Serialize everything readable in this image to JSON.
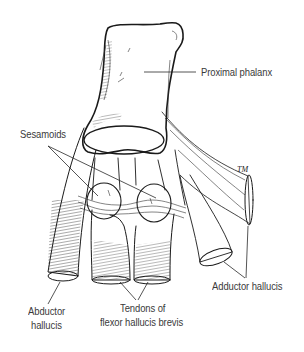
{
  "figure": {
    "signature": "TM",
    "colors": {
      "ink": "#1a1a1a",
      "label_text": "#3a3a3a",
      "background": "#ffffff"
    }
  },
  "labels": {
    "proximal_phalanx": "Proximal phalanx",
    "sesamoids": "Sesamoids",
    "adductor_hallucis": "Adductor hallucis",
    "abductor_hallucis_line1": "Abductor",
    "abductor_hallucis_line2": "hallucis",
    "flexor_line1": "Tendons of",
    "flexor_line2": "flexor hallucis brevis"
  }
}
